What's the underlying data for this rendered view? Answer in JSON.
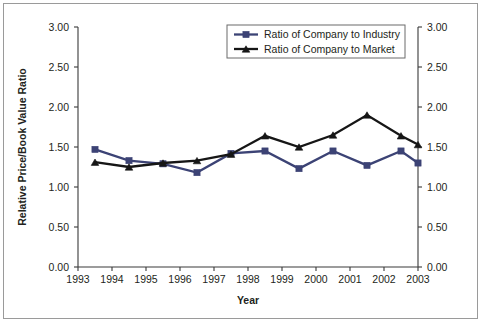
{
  "chart_data": {
    "type": "line",
    "title": "",
    "subtitle": "",
    "xlabel": "Year",
    "ylabel": "Relative Price/Book Value Ratio",
    "ylabel_right": "",
    "x_tick_labels": [
      "1993",
      "1994",
      "1995",
      "1996",
      "1997",
      "1998",
      "1999",
      "2000",
      "2001",
      "2002",
      "2003"
    ],
    "y_tick_labels": [
      "0.00",
      "0.50",
      "1.00",
      "1.50",
      "2.00",
      "2.50",
      "3.00"
    ],
    "y_tick_values": [
      0.0,
      0.5,
      1.0,
      1.5,
      2.0,
      2.5,
      3.0
    ],
    "ylim": [
      0.0,
      3.0
    ],
    "xlim": [
      1993,
      2003
    ],
    "grid": false,
    "right_axis_mirrored": true,
    "right_y_tick_labels": [
      "0.00",
      "0.50",
      "1.00",
      "1.50",
      "2.00",
      "2.50",
      "3.00"
    ],
    "legend_position": "top-center-right",
    "x_points": [
      1993.5,
      1994.5,
      1995.5,
      1996.5,
      1997.5,
      1998.5,
      1999.5,
      2000.5,
      2001.5,
      2002.5
    ],
    "series": [
      {
        "name": "Ratio of Company to Industry",
        "color": "#3c4375",
        "marker": "square",
        "values": [
          1.47,
          1.33,
          1.29,
          1.18,
          1.42,
          1.45,
          1.23,
          1.45,
          1.27,
          1.45
        ]
      },
      {
        "name": "Ratio of Company to Market",
        "color": "#161616",
        "marker": "triangle",
        "values": [
          1.31,
          1.25,
          1.3,
          1.33,
          1.41,
          1.64,
          1.5,
          1.65,
          1.9,
          1.64
        ]
      }
    ],
    "final_points": {
      "note_visible": false,
      "industry_last": 1.3,
      "market_last": 1.53
    }
  },
  "legend": {
    "entries": [
      {
        "label": "Ratio of Company to Industry"
      },
      {
        "label": "Ratio of Company to Market"
      }
    ]
  },
  "axes": {
    "x_title": "Year",
    "y_title": "Relative Price/Book Value Ratio"
  }
}
